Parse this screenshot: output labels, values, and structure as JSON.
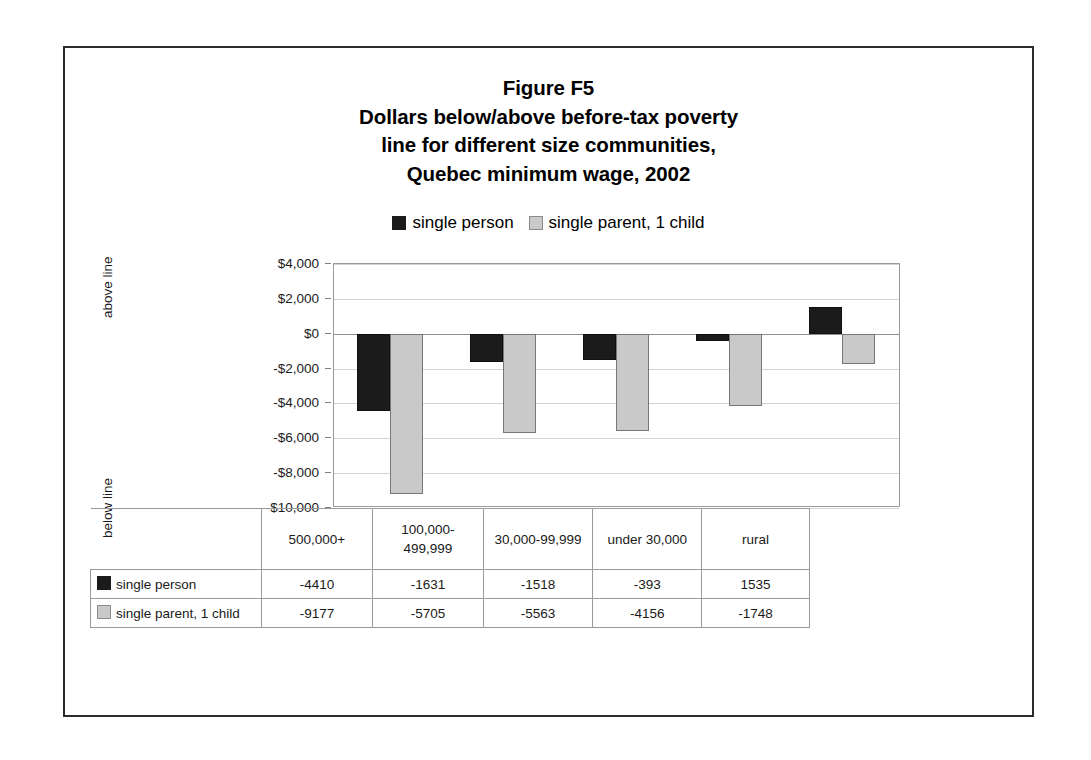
{
  "figure": {
    "title_lines": [
      "Figure F5",
      "Dollars below/above before-tax poverty",
      "line for different size communities,",
      "Quebec minimum wage, 2002"
    ]
  },
  "legend": {
    "entries": [
      {
        "label": "single person",
        "color": "#1b1b1b"
      },
      {
        "label": "single parent, 1 child",
        "color": "#c9c9c9"
      }
    ]
  },
  "axis": {
    "above_caption": "above line",
    "below_caption": "below line",
    "tick_labels": [
      "$4,000",
      "$2,000",
      "$0",
      "-$2,000",
      "-$4,000",
      "-$6,000",
      "-$8,000",
      "-$10,000"
    ]
  },
  "table": {
    "row_labels": [
      "single person",
      "single parent, 1 child"
    ],
    "categories": [
      "500,000+",
      "100,000-499,999",
      "30,000-99,999",
      "under 30,000",
      "rural"
    ],
    "rows": [
      [
        "-4410",
        "-1631",
        "-1518",
        "-393",
        "1535"
      ],
      [
        "-9177",
        "-5705",
        "-5563",
        "-4156",
        "-1748"
      ]
    ]
  },
  "chart_data": {
    "type": "bar",
    "xlabel": "",
    "ylabel": "",
    "categories": [
      "500,000+",
      "100,000-499,999",
      "30,000-99,999",
      "under 30,000",
      "rural"
    ],
    "series": [
      {
        "name": "single person",
        "color": "#1b1b1b",
        "values": [
          -4410,
          -1631,
          -1518,
          -393,
          1535
        ]
      },
      {
        "name": "single parent, 1 child",
        "color": "#c9c9c9",
        "values": [
          -9177,
          -5705,
          -5563,
          -4156,
          -1748
        ]
      }
    ],
    "ylim": [
      -10000,
      4000
    ],
    "ytick_step": 2000,
    "grid": true,
    "legend_position": "top"
  }
}
